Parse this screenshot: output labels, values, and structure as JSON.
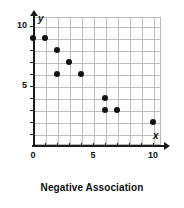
{
  "caption": "Negative Association",
  "axis": {
    "x_letter": "x",
    "y_letter": "y"
  },
  "chart_data": {
    "type": "scatter",
    "title": "Negative Association",
    "xlabel": "x",
    "ylabel": "y",
    "xlim": [
      0,
      11
    ],
    "ylim": [
      0,
      11
    ],
    "grid": true,
    "legend": "none",
    "x_ticks": [
      0,
      1,
      2,
      3,
      4,
      5,
      6,
      7,
      8,
      9,
      10
    ],
    "y_ticks": [
      0,
      1,
      2,
      3,
      4,
      5,
      6,
      7,
      8,
      9,
      10
    ],
    "x_tick_labels": [
      "0",
      "",
      "",
      "",
      "",
      "5",
      "",
      "",
      "",
      "",
      "10"
    ],
    "y_tick_labels": [
      "",
      "",
      "",
      "",
      "",
      "5",
      "",
      "",
      "",
      "",
      "10"
    ],
    "x_major_labels": [
      {
        "value": 0,
        "label": "0"
      },
      {
        "value": 5,
        "label": "5"
      },
      {
        "value": 10,
        "label": "10"
      }
    ],
    "y_major_labels": [
      {
        "value": 5,
        "label": "5"
      },
      {
        "value": 10,
        "label": "10"
      }
    ],
    "points": [
      {
        "x": 0,
        "y": 9
      },
      {
        "x": 1,
        "y": 9
      },
      {
        "x": 2,
        "y": 8
      },
      {
        "x": 3,
        "y": 7
      },
      {
        "x": 2,
        "y": 6
      },
      {
        "x": 4,
        "y": 6
      },
      {
        "x": 6,
        "y": 4
      },
      {
        "x": 6,
        "y": 3
      },
      {
        "x": 7,
        "y": 3
      },
      {
        "x": 10,
        "y": 2
      }
    ],
    "x": [
      0,
      1,
      2,
      3,
      2,
      4,
      6,
      6,
      7,
      10
    ],
    "y": [
      9,
      9,
      8,
      7,
      6,
      6,
      4,
      3,
      3,
      2
    ],
    "colors": {
      "point": "#111111",
      "axis": "#1a1a1a",
      "grid": "#bdbdbd",
      "background": "#ffffff"
    }
  }
}
